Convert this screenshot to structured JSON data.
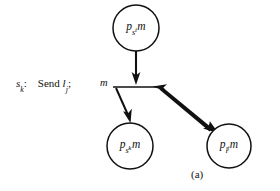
{
  "figure": {
    "caption": "(a)",
    "message_label": "m",
    "statement": {
      "state_symbol": "s",
      "state_subscript": "k",
      "colon": ":",
      "keyword": "Send",
      "operand_symbol": "l",
      "operand_subscript": "j",
      "terminator": ";",
      "full_text": "s_k:  Send l_j;"
    },
    "nodes": [
      {
        "id": "node-top",
        "symbol": "p",
        "subscript_main": "s",
        "subscript_inner": "i",
        "suffix": "m",
        "full_text": "p_{s_i}m",
        "cx": 136,
        "cy": 28,
        "r": 23
      },
      {
        "id": "node-bottom-left",
        "symbol": "p",
        "subscript_main": "s",
        "subscript_inner": "k",
        "suffix": "m",
        "full_text": "p_{s_k}m",
        "cx": 130,
        "cy": 146,
        "r": 23
      },
      {
        "id": "node-bottom-right",
        "symbol": "p",
        "subscript_main": "l",
        "subscript_inner": "j",
        "suffix": "m",
        "full_text": "p_{l_j}m",
        "cx": 229,
        "cy": 146,
        "r": 22
      }
    ],
    "edges": [
      {
        "id": "edge-top-to-junction",
        "from": "node-top",
        "to": "junction-bar",
        "style": "thin-arrow",
        "direction": "down"
      },
      {
        "id": "edge-junction-to-bottom-left",
        "from": "junction-bar",
        "to": "node-bottom-left",
        "style": "thin-arrow",
        "direction": "down-left"
      },
      {
        "id": "edge-junction-to-bottom-right",
        "from": "junction-bar",
        "to": "node-bottom-right",
        "style": "thick-double-arrow",
        "direction": "down-right"
      }
    ],
    "colors": {
      "ink": "#111111",
      "background": "#ffffff"
    }
  }
}
